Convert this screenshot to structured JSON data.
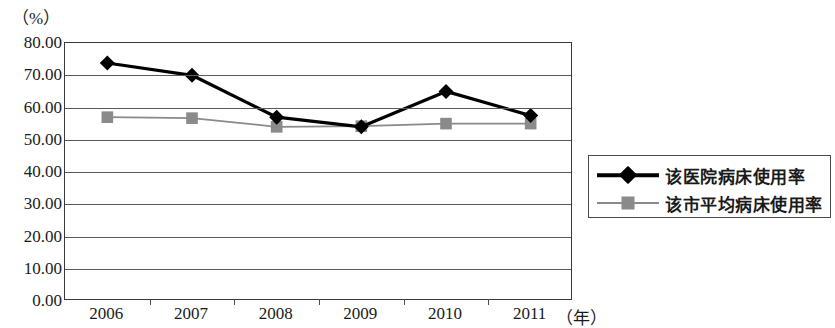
{
  "chart_data": {
    "type": "line",
    "title": "",
    "xlabel": "（年）",
    "ylabel": "（%）",
    "categories": [
      "2006",
      "2007",
      "2008",
      "2009",
      "2010",
      "2011"
    ],
    "ylim": [
      0,
      80
    ],
    "ytick_step": 10,
    "ytick_labels": [
      "80.00",
      "70.00",
      "60.00",
      "50.00",
      "40.00",
      "30.00",
      "20.00",
      "10.00",
      "0.00"
    ],
    "ytick_values": [
      80,
      70,
      60,
      50,
      40,
      30,
      20,
      10,
      0
    ],
    "grid": true,
    "legend_position": "right",
    "series": [
      {
        "name": "该医院病床使用率",
        "marker": "diamond",
        "color": "#000000",
        "values": [
          73.8,
          70.0,
          57.0,
          54.0,
          65.0,
          57.5
        ]
      },
      {
        "name": "该市平均病床使用率",
        "marker": "square",
        "color": "#8a8a8a",
        "values": [
          57.0,
          56.7,
          54.0,
          54.2,
          55.0,
          55.0
        ]
      }
    ]
  },
  "legend": {
    "entries": [
      {
        "label": "该医院病床使用率",
        "marker": "diamond-marker",
        "color": "#000000"
      },
      {
        "label": "该市平均病床使用率",
        "marker": "square-marker",
        "color": "#8a8a8a"
      }
    ]
  }
}
